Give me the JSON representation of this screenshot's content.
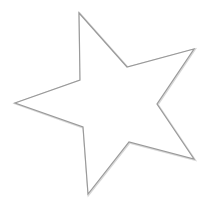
{
  "canvas": {
    "width": 208,
    "height": 211,
    "background": "#ffffff"
  },
  "shape": {
    "type": "five-pointed-star",
    "label": "Star",
    "fill": "#ffffff",
    "stroke": "#9a9a9a",
    "stroke_width": 1.2,
    "points": [
      [
        79,
        13
      ],
      [
        127,
        67
      ],
      [
        194,
        49
      ],
      [
        157,
        104
      ],
      [
        194,
        159
      ],
      [
        129,
        142
      ],
      [
        88,
        194
      ],
      [
        83,
        127
      ],
      [
        15,
        103
      ],
      [
        80,
        80
      ]
    ]
  }
}
